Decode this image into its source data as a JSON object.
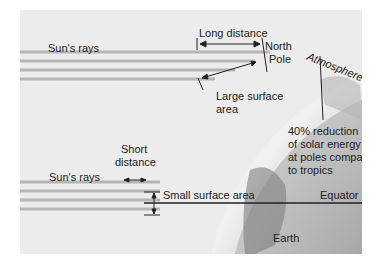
{
  "diagram": {
    "labels": {
      "suns_rays_top": "Sun's rays",
      "suns_rays_bottom": "Sun's rays",
      "long_distance": "Long distance",
      "north_pole": "North Pole",
      "north_pole_line1": "North",
      "north_pole_line2": "Pole",
      "atmosphere": "Atmosphere",
      "large_surface_area_line1": "Large surface",
      "large_surface_area_line2": "area",
      "reduction_line1": "40% reduction",
      "reduction_line2": "of solar energy",
      "reduction_line3": "at poles compared",
      "reduction_line4": "to tropics",
      "short_distance_line1": "Short",
      "short_distance_line2": "distance",
      "small_surface_area": "Small surface area",
      "equator": "Equator",
      "earth": "Earth"
    },
    "colors": {
      "background": "#ececec",
      "rays": "#b0b0b0",
      "atmosphere": "#d8d8d8",
      "earth": "#9a9a9a",
      "lines": "#222222"
    }
  }
}
